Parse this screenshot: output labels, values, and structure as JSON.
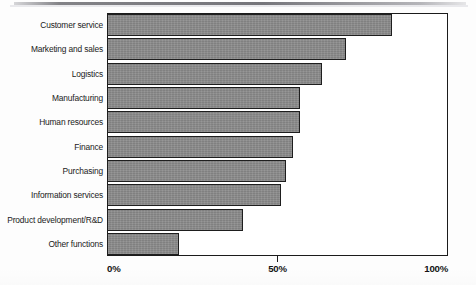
{
  "chart_data": {
    "type": "bar",
    "orientation": "horizontal",
    "title": "",
    "subtitle": "",
    "xlabel": "",
    "ylabel": "",
    "xlim": [
      0,
      100
    ],
    "xticks": [
      0,
      50,
      100
    ],
    "xticklabels": [
      "0%",
      "50%",
      "100%"
    ],
    "grid": false,
    "legend": null,
    "bar_color": "#8b8b8b",
    "bar_edge_color": "#1e1e1e",
    "frame_color": "#1b1b1b",
    "categories": [
      "Customer service",
      "Marketing and sales",
      "Logistics",
      "Manufacturing",
      "Human resources",
      "Finance",
      "Purchasing",
      "Information services",
      "Product development/R&D",
      "Other functions"
    ],
    "values": [
      83.5,
      70,
      63,
      56.5,
      56.5,
      54.5,
      52.5,
      51,
      40,
      21
    ]
  },
  "axis": {
    "ticks": [
      {
        "label": "0%",
        "value": 0
      },
      {
        "label": "50%",
        "value": 50
      },
      {
        "label": "100%",
        "value": 100
      }
    ]
  }
}
